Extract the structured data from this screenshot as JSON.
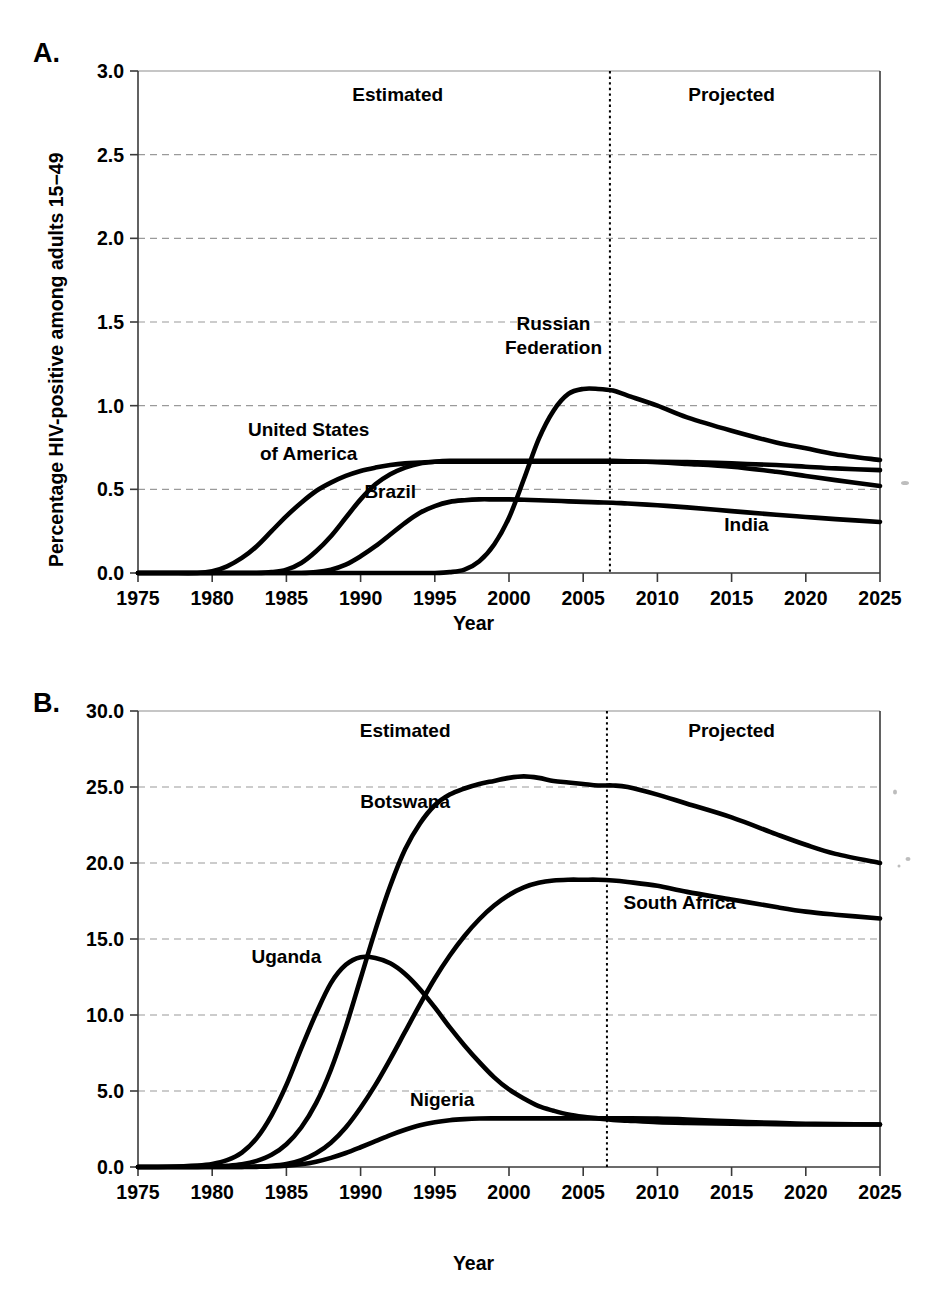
{
  "figure": {
    "panels": [
      {
        "id": "a",
        "letter": "A.",
        "ylabel": "Percentage HIV-positive among adults 15−49",
        "xlabel": "Year",
        "estimated_label": "Estimated",
        "projected_label": "Projected"
      },
      {
        "id": "b",
        "letter": "B.",
        "ylabel": "Percentage HIV-positive among adults 15−49",
        "xlabel": "Year",
        "estimated_label": "Estimated",
        "projected_label": "Projected"
      }
    ]
  },
  "chart_data": [
    {
      "type": "line",
      "panel": "A",
      "title": "",
      "xlabel": "Year",
      "ylabel": "Percentage HIV-positive among adults 15−49",
      "xlim": [
        1975,
        2025
      ],
      "ylim": [
        0.0,
        3.0
      ],
      "xticks": [
        1975,
        1980,
        1985,
        1990,
        1995,
        2000,
        2005,
        2010,
        2015,
        2020,
        2025
      ],
      "yticks": [
        0.0,
        0.5,
        1.0,
        1.5,
        2.0,
        2.5,
        3.0
      ],
      "ytick_labels": [
        "0.0",
        "0.5",
        "1.0",
        "1.5",
        "2.0",
        "2.5",
        "3.0"
      ],
      "xtick_labels": [
        "1975",
        "1980",
        "1985",
        "1990",
        "1995",
        "2000",
        "2005",
        "2010",
        "2015",
        "2020",
        "2025"
      ],
      "grid": "horizontal-dashed",
      "legend": "inline-annotations",
      "annotations": [
        {
          "text": "Estimated",
          "x": 1992.5,
          "y": 2.82
        },
        {
          "text": "Projected",
          "x": 2015.0,
          "y": 2.82
        },
        {
          "text": "Russian Federation",
          "x": 2003.0,
          "y": 1.45
        },
        {
          "text": "United States of America",
          "x": 1986.5,
          "y": 0.82
        },
        {
          "text": "Brazil",
          "x": 1992.0,
          "y": 0.45
        },
        {
          "text": "India",
          "x": 2016.0,
          "y": 0.25
        }
      ],
      "divider_year": 2006.8,
      "x": [
        1975,
        1977,
        1979,
        1980,
        1981,
        1982,
        1983,
        1984,
        1985,
        1986,
        1987,
        1988,
        1989,
        1990,
        1991,
        1992,
        1993,
        1994,
        1995,
        1996,
        1997,
        1998,
        1999,
        2000,
        2001,
        2002,
        2003,
        2004,
        2005,
        2006,
        2007,
        2008,
        2010,
        2012,
        2015,
        2018,
        2020,
        2022,
        2025
      ],
      "series": [
        {
          "name": "United States of America",
          "values": [
            0.0,
            0.0,
            0.0,
            0.01,
            0.04,
            0.09,
            0.16,
            0.25,
            0.34,
            0.42,
            0.49,
            0.54,
            0.58,
            0.61,
            0.63,
            0.645,
            0.655,
            0.66,
            0.665,
            0.665,
            0.665,
            0.665,
            0.665,
            0.665,
            0.665,
            0.665,
            0.665,
            0.665,
            0.665,
            0.665,
            0.665,
            0.665,
            0.665,
            0.663,
            0.655,
            0.645,
            0.635,
            0.625,
            0.615
          ]
        },
        {
          "name": "Brazil",
          "values": [
            0.0,
            0.0,
            0.0,
            0.0,
            0.0,
            0.0,
            0.0,
            0.005,
            0.02,
            0.06,
            0.13,
            0.22,
            0.33,
            0.44,
            0.53,
            0.59,
            0.63,
            0.655,
            0.665,
            0.67,
            0.67,
            0.67,
            0.67,
            0.67,
            0.67,
            0.67,
            0.67,
            0.67,
            0.67,
            0.67,
            0.67,
            0.668,
            0.662,
            0.652,
            0.635,
            0.605,
            0.58,
            0.555,
            0.52
          ]
        },
        {
          "name": "India",
          "values": [
            0.0,
            0.0,
            0.0,
            0.0,
            0.0,
            0.0,
            0.0,
            0.0,
            0.0,
            0.0,
            0.005,
            0.02,
            0.05,
            0.1,
            0.16,
            0.23,
            0.3,
            0.36,
            0.4,
            0.425,
            0.435,
            0.44,
            0.44,
            0.44,
            0.438,
            0.435,
            0.432,
            0.428,
            0.425,
            0.422,
            0.42,
            0.415,
            0.405,
            0.392,
            0.37,
            0.348,
            0.335,
            0.322,
            0.305
          ]
        },
        {
          "name": "Russian Federation",
          "values": [
            0.0,
            0.0,
            0.0,
            0.0,
            0.0,
            0.0,
            0.0,
            0.0,
            0.0,
            0.0,
            0.0,
            0.0,
            0.0,
            0.0,
            0.0,
            0.0,
            0.0,
            0.0,
            0.0,
            0.005,
            0.02,
            0.07,
            0.17,
            0.33,
            0.56,
            0.8,
            0.97,
            1.07,
            1.1,
            1.1,
            1.09,
            1.06,
            1.0,
            0.93,
            0.85,
            0.78,
            0.745,
            0.71,
            0.675
          ]
        }
      ]
    },
    {
      "type": "line",
      "panel": "B",
      "title": "",
      "xlabel": "Year",
      "ylabel": "Percentage HIV-positive among adults 15−49",
      "xlim": [
        1975,
        2025
      ],
      "ylim": [
        0.0,
        30.0
      ],
      "xticks": [
        1975,
        1980,
        1985,
        1990,
        1995,
        2000,
        2005,
        2010,
        2015,
        2020,
        2025
      ],
      "yticks": [
        0.0,
        5.0,
        10.0,
        15.0,
        20.0,
        25.0,
        30.0
      ],
      "ytick_labels": [
        "0.0",
        "5.0",
        "10.0",
        "15.0",
        "20.0",
        "25.0",
        "30.0"
      ],
      "xtick_labels": [
        "1975",
        "1980",
        "1985",
        "1990",
        "1995",
        "2000",
        "2005",
        "2010",
        "2015",
        "2020",
        "2025"
      ],
      "grid": "horizontal-dashed",
      "legend": "inline-annotations",
      "annotations": [
        {
          "text": "Estimated",
          "x": 1993.0,
          "y": 28.3
        },
        {
          "text": "Projected",
          "x": 2015.0,
          "y": 28.3
        },
        {
          "text": "Botswana",
          "x": 1993.0,
          "y": 23.6
        },
        {
          "text": "South Africa",
          "x": 2011.5,
          "y": 17.0
        },
        {
          "text": "Uganda",
          "x": 1985.0,
          "y": 13.4
        },
        {
          "text": "Nigeria",
          "x": 1995.5,
          "y": 4.0
        }
      ],
      "divider_year": 2006.6,
      "x": [
        1975,
        1977,
        1979,
        1980,
        1981,
        1982,
        1983,
        1984,
        1985,
        1986,
        1987,
        1988,
        1989,
        1990,
        1991,
        1992,
        1993,
        1994,
        1995,
        1996,
        1997,
        1998,
        1999,
        2000,
        2001,
        2002,
        2003,
        2004,
        2005,
        2006,
        2007,
        2008,
        2010,
        2012,
        2015,
        2018,
        2020,
        2022,
        2025
      ],
      "series": [
        {
          "name": "Uganda",
          "values": [
            0.0,
            0.02,
            0.1,
            0.2,
            0.45,
            0.95,
            1.9,
            3.4,
            5.4,
            7.8,
            10.1,
            12.1,
            13.3,
            13.8,
            13.75,
            13.4,
            12.7,
            11.7,
            10.5,
            9.2,
            8.0,
            6.9,
            5.9,
            5.1,
            4.5,
            4.0,
            3.7,
            3.45,
            3.3,
            3.2,
            3.1,
            3.05,
            2.95,
            2.9,
            2.85,
            2.82,
            2.8,
            2.8,
            2.8
          ]
        },
        {
          "name": "Botswana",
          "values": [
            0.0,
            0.0,
            0.01,
            0.03,
            0.08,
            0.18,
            0.4,
            0.8,
            1.5,
            2.6,
            4.2,
            6.4,
            9.2,
            12.4,
            15.6,
            18.5,
            20.9,
            22.6,
            23.8,
            24.5,
            24.9,
            25.2,
            25.4,
            25.6,
            25.7,
            25.6,
            25.4,
            25.3,
            25.2,
            25.1,
            25.1,
            25.0,
            24.5,
            23.9,
            23.0,
            21.9,
            21.2,
            20.6,
            20.0
          ]
        },
        {
          "name": "South Africa",
          "values": [
            0.0,
            0.0,
            0.0,
            0.0,
            0.0,
            0.01,
            0.03,
            0.08,
            0.2,
            0.45,
            0.9,
            1.6,
            2.6,
            3.9,
            5.4,
            7.1,
            8.9,
            10.7,
            12.4,
            13.9,
            15.2,
            16.3,
            17.2,
            17.9,
            18.4,
            18.7,
            18.85,
            18.9,
            18.9,
            18.9,
            18.85,
            18.75,
            18.5,
            18.1,
            17.6,
            17.1,
            16.8,
            16.6,
            16.35
          ]
        },
        {
          "name": "Nigeria",
          "values": [
            0.0,
            0.0,
            0.0,
            0.0,
            0.0,
            0.0,
            0.01,
            0.03,
            0.08,
            0.18,
            0.35,
            0.6,
            0.92,
            1.3,
            1.7,
            2.1,
            2.45,
            2.75,
            2.95,
            3.08,
            3.15,
            3.19,
            3.2,
            3.2,
            3.2,
            3.2,
            3.2,
            3.2,
            3.2,
            3.2,
            3.2,
            3.2,
            3.18,
            3.12,
            3.0,
            2.9,
            2.85,
            2.82,
            2.8
          ]
        }
      ]
    }
  ]
}
